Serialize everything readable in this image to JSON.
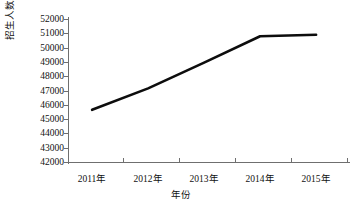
{
  "chart_data": {
    "type": "line",
    "title": "",
    "subtitle": "",
    "xlabel": "年份",
    "ylabel": "招生人数/人",
    "categories": [
      "2011年",
      "2012年",
      "2013年",
      "2014年",
      "2015年"
    ],
    "values": [
      45650,
      47150,
      48950,
      50800,
      50900
    ],
    "series": [
      {
        "name": "招生人数",
        "values": [
          45650,
          47150,
          48950,
          50800,
          50900
        ]
      }
    ],
    "ylim": [
      42000,
      52000
    ],
    "ytick_labels": [
      "52000",
      "51000",
      "50000",
      "49000",
      "48000",
      "47000",
      "46000",
      "45000",
      "44000",
      "43000",
      "42000"
    ],
    "ytick_values": [
      52000,
      51000,
      50000,
      49000,
      48000,
      47000,
      46000,
      45000,
      44000,
      43000,
      42000
    ],
    "xtick_labels": [
      "2011年",
      "2012年",
      "2013年",
      "2014年",
      "2015年"
    ],
    "grid": false,
    "legend": false,
    "legend_position": "none",
    "line_color": "#0d0d0d",
    "axis_color": "#6f6f6f",
    "background_color": "#ffffff",
    "markers": false
  }
}
